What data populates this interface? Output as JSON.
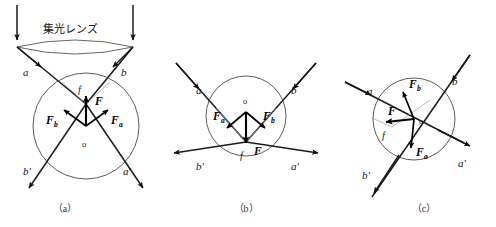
{
  "figure": {
    "title_text": "集光レンズ",
    "title_meaning": "condenser lens",
    "captions": {
      "a": "（a）",
      "b": "（b）",
      "c": "（c）"
    }
  },
  "panel_a": {
    "caption": "（a）",
    "lens_label": "集光レンズ",
    "ray_labels": {
      "in_left": "a",
      "in_right": "b",
      "out_left": "b'",
      "out_right": "a'"
    },
    "force_labels": {
      "resultant": "F",
      "from_a": "F",
      "from_a_sub": "a",
      "from_b": "F",
      "from_b_sub": "b"
    },
    "point_labels": {
      "center": "o",
      "focus": "f"
    },
    "description": "Focus f above sphere center o; net force F points up toward focus"
  },
  "panel_b": {
    "caption": "（b）",
    "ray_labels": {
      "in_left": "a",
      "in_right": "b",
      "out_left": "b'",
      "out_right": "a'"
    },
    "force_labels": {
      "resultant": "F",
      "from_a": "F",
      "from_a_sub": "a",
      "from_b": "F",
      "from_b_sub": "b"
    },
    "point_labels": {
      "center": "o",
      "focus": "f"
    },
    "description": "Focus f below sphere center o; net force F points down toward focus"
  },
  "panel_c": {
    "caption": "（c）",
    "ray_labels": {
      "in_left": "a",
      "in_right": "b",
      "out_left": "b'",
      "out_right": "a'"
    },
    "force_labels": {
      "resultant": "F",
      "from_a": "F",
      "from_a_sub": "a",
      "from_b": "F",
      "from_b_sub": "b"
    },
    "point_labels": {
      "center": "o",
      "focus": "f"
    },
    "description": "Focus f offset to lower-left of center o; net force F points left toward focus"
  },
  "colors": {
    "background": "#ffffff",
    "ray_stroke": "#1a1a1a",
    "circle_stroke": "#4a4a4a",
    "vector_stroke": "#000000",
    "cone_stroke": "#9a9a9a",
    "text": "#111111"
  }
}
